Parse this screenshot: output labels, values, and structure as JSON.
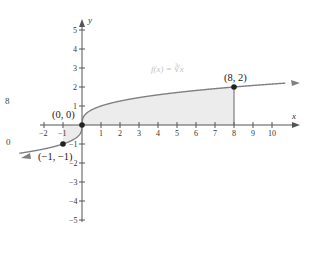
{
  "chart_data": {
    "type": "line",
    "title": "",
    "function_label": "f(x) = ∛x",
    "xlabel": "x",
    "ylabel": "y",
    "xlim": [
      -2,
      10
    ],
    "ylim": [
      -5,
      5
    ],
    "x_ticks": [
      -2,
      -1,
      1,
      2,
      3,
      4,
      5,
      6,
      7,
      8,
      9,
      10
    ],
    "y_ticks": [
      -5,
      -4,
      -3,
      -2,
      -1,
      1,
      2,
      3,
      4,
      5
    ],
    "grid": false,
    "series": [
      {
        "name": "f(x) = cube root of x",
        "color": "#808080",
        "x": [
          -3.5,
          -2,
          -1,
          -0.5,
          -0.125,
          0,
          0.125,
          0.5,
          1,
          2,
          3,
          4,
          5,
          6,
          7,
          8,
          10.5
        ],
        "y": [
          -1.518,
          -1.26,
          -1,
          -0.794,
          -0.5,
          0,
          0.5,
          0.794,
          1,
          1.26,
          1.442,
          1.587,
          1.71,
          1.817,
          1.913,
          2,
          2.19
        ]
      }
    ],
    "shaded_region": {
      "description": "area between curve and x-axis from x=-1 to x=8",
      "from": -1,
      "to": 8,
      "color": "#ececec"
    },
    "points": [
      {
        "label": "(0, 0)",
        "x": 0,
        "y": 0
      },
      {
        "label": "(8, 2)",
        "x": 8,
        "y": 2
      },
      {
        "label": "(−1, −1)",
        "x": -1,
        "y": -1
      }
    ],
    "annotations": [
      "vertical line from (8, 0) to (8, 2)"
    ],
    "cropped_fragments": [
      "8",
      "0"
    ]
  }
}
